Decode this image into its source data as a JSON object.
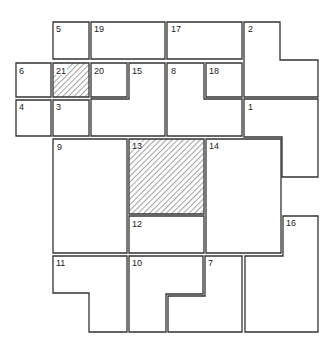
{
  "diagram": {
    "type": "polyomino-tiling-puzzle",
    "grid": {
      "cols": 8,
      "rows": 8,
      "cell_px": 38.5,
      "origin": [
        14,
        21
      ]
    },
    "colors": {
      "stroke": "#333333",
      "fill": "#ffffff",
      "hatch": "#555555"
    },
    "pieces": [
      {
        "id": "1",
        "label": "1",
        "hatched": false,
        "cells": [
          [
            6,
            2
          ],
          [
            7,
            2
          ],
          [
            6,
            3
          ],
          [
            7,
            3
          ],
          [
            7,
            4
          ]
        ]
      },
      {
        "id": "2",
        "label": "2",
        "hatched": false,
        "cells": [
          [
            6,
            0
          ],
          [
            6,
            1
          ],
          [
            7,
            1
          ]
        ]
      },
      {
        "id": "3",
        "label": "3",
        "hatched": false,
        "cells": [
          [
            1,
            2
          ]
        ]
      },
      {
        "id": "4",
        "label": "4",
        "hatched": false,
        "cells": [
          [
            0,
            2
          ]
        ]
      },
      {
        "id": "5",
        "label": "5",
        "hatched": false,
        "cells": [
          [
            1,
            0
          ]
        ]
      },
      {
        "id": "6",
        "label": "6",
        "hatched": false,
        "cells": [
          [
            0,
            1
          ]
        ]
      },
      {
        "id": "7",
        "label": "7",
        "hatched": false,
        "cells": [
          [
            5,
            6
          ],
          [
            4,
            7
          ],
          [
            5,
            7
          ]
        ]
      },
      {
        "id": "8",
        "label": "8",
        "hatched": false,
        "cells": [
          [
            4,
            1
          ],
          [
            4,
            2
          ],
          [
            5,
            2
          ]
        ]
      },
      {
        "id": "9",
        "label": "9",
        "hatched": false,
        "cells": [
          [
            1,
            3
          ],
          [
            2,
            3
          ],
          [
            1,
            4
          ],
          [
            2,
            4
          ],
          [
            1,
            5
          ],
          [
            2,
            5
          ]
        ]
      },
      {
        "id": "10",
        "label": "10",
        "hatched": false,
        "cells": [
          [
            3,
            6
          ],
          [
            4,
            6
          ],
          [
            3,
            7
          ]
        ]
      },
      {
        "id": "11",
        "label": "11",
        "hatched": false,
        "cells": [
          [
            1,
            6
          ],
          [
            2,
            6
          ],
          [
            2,
            7
          ]
        ]
      },
      {
        "id": "12",
        "label": "12",
        "hatched": false,
        "cells": [
          [
            3,
            5
          ],
          [
            4,
            5
          ]
        ]
      },
      {
        "id": "13",
        "label": "13",
        "hatched": true,
        "cells": [
          [
            3,
            3
          ],
          [
            4,
            3
          ],
          [
            3,
            4
          ],
          [
            4,
            4
          ]
        ]
      },
      {
        "id": "14",
        "label": "14",
        "hatched": false,
        "cells": [
          [
            5,
            3
          ],
          [
            6,
            3
          ],
          [
            5,
            4
          ],
          [
            6,
            4
          ],
          [
            5,
            5
          ],
          [
            6,
            5
          ]
        ]
      },
      {
        "id": "15",
        "label": "15",
        "hatched": false,
        "cells": [
          [
            3,
            1
          ],
          [
            2,
            2
          ],
          [
            3,
            2
          ]
        ]
      },
      {
        "id": "16",
        "label": "16",
        "hatched": false,
        "cells": [
          [
            7,
            5
          ],
          [
            6,
            6
          ],
          [
            7,
            6
          ],
          [
            6,
            7
          ],
          [
            7,
            7
          ]
        ]
      },
      {
        "id": "17",
        "label": "17",
        "hatched": false,
        "cells": [
          [
            4,
            0
          ],
          [
            5,
            0
          ]
        ]
      },
      {
        "id": "18",
        "label": "18",
        "hatched": false,
        "cells": [
          [
            5,
            1
          ]
        ]
      },
      {
        "id": "19",
        "label": "19",
        "hatched": false,
        "cells": [
          [
            2,
            0
          ],
          [
            3,
            0
          ]
        ]
      },
      {
        "id": "20",
        "label": "20",
        "hatched": false,
        "cells": [
          [
            2,
            1
          ]
        ]
      },
      {
        "id": "21",
        "label": "21",
        "hatched": true,
        "cells": [
          [
            1,
            1
          ]
        ]
      }
    ]
  }
}
